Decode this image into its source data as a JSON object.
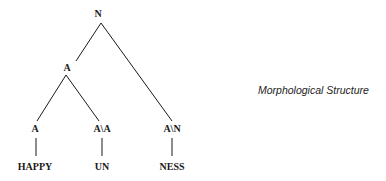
{
  "caption": "Morphological Structure",
  "tree": {
    "nodes": [
      {
        "id": "root",
        "label": "N",
        "x": 98,
        "y": 14
      },
      {
        "id": "adj",
        "label": "A",
        "x": 67,
        "y": 68
      },
      {
        "id": "adj-leaf",
        "label": "A",
        "x": 35,
        "y": 129
      },
      {
        "id": "prefix",
        "label": "A\\A",
        "x": 102,
        "y": 129
      },
      {
        "id": "suffix",
        "label": "A\\N",
        "x": 172,
        "y": 129
      },
      {
        "id": "word-happy",
        "label": "HAPPY",
        "x": 35,
        "y": 167
      },
      {
        "id": "word-un",
        "label": "UN",
        "x": 102,
        "y": 167
      },
      {
        "id": "word-ness",
        "label": "NESS",
        "x": 172,
        "y": 167
      }
    ],
    "edges": [
      {
        "from": "root",
        "to": "adj"
      },
      {
        "from": "root",
        "to": "suffix"
      },
      {
        "from": "adj",
        "to": "adj-leaf"
      },
      {
        "from": "adj",
        "to": "prefix"
      },
      {
        "from": "adj-leaf",
        "to": "word-happy"
      },
      {
        "from": "prefix",
        "to": "word-un"
      },
      {
        "from": "suffix",
        "to": "word-ness"
      }
    ]
  }
}
